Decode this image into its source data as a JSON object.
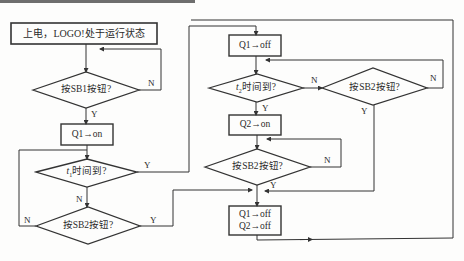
{
  "diagram": {
    "type": "flowchart",
    "nodes": {
      "start": {
        "label": "上电，LOGO!处于运行状态",
        "shape": "rect"
      },
      "sb1": {
        "label": "按SB1按钮?",
        "shape": "diamond"
      },
      "q1on": {
        "label": "Q1→on",
        "shape": "rect"
      },
      "t1": {
        "prefix": "t",
        "sub": "1",
        "suffix": "时间到?",
        "shape": "diamond"
      },
      "sb2a": {
        "label": "按SB2按钮?",
        "shape": "diamond"
      },
      "q1off": {
        "label": "Q1→off",
        "shape": "rect"
      },
      "t2": {
        "prefix": "t",
        "sub": "2",
        "suffix": "时间到?",
        "shape": "diamond"
      },
      "sb2b": {
        "label": "按SB2按钮?",
        "shape": "diamond"
      },
      "q2on": {
        "label": "Q2→on",
        "shape": "rect"
      },
      "sb2c": {
        "label": "按SB2按钮?",
        "shape": "diamond"
      },
      "alloff": {
        "line1": "Q1→off",
        "line2": "Q2→off",
        "shape": "rect"
      }
    },
    "edge_labels": {
      "sb1_n": "N",
      "sb1_y": "Y",
      "t1_y": "Y",
      "t1_n": "N",
      "sb2a_n": "N",
      "sb2a_y": "Y",
      "t2_n": "N",
      "t2_y": "Y",
      "sb2b_n": "N",
      "sb2b_y": "Y",
      "sb2c_n": "N",
      "sb2c_y": "Y"
    },
    "edges": [
      [
        "start",
        "sb1"
      ],
      [
        "sb1",
        "sb1",
        "N"
      ],
      [
        "sb1",
        "q1on",
        "Y"
      ],
      [
        "q1on",
        "t1"
      ],
      [
        "t1",
        "q1off",
        "Y"
      ],
      [
        "t1",
        "sb2a",
        "N"
      ],
      [
        "sb2a",
        "t1",
        "N"
      ],
      [
        "sb2a",
        "alloff",
        "Y"
      ],
      [
        "q1off",
        "t2"
      ],
      [
        "t2",
        "sb2b",
        "N"
      ],
      [
        "t2",
        "q2on",
        "Y"
      ],
      [
        "sb2b",
        "t2",
        "N"
      ],
      [
        "sb2b",
        "alloff",
        "Y"
      ],
      [
        "q2on",
        "sb2c"
      ],
      [
        "sb2c",
        "sb2c",
        "N"
      ],
      [
        "sb2c",
        "alloff",
        "Y"
      ],
      [
        "alloff",
        "sb1"
      ]
    ],
    "colors": {
      "line": "#333333",
      "background": "#fdfdfc"
    }
  }
}
